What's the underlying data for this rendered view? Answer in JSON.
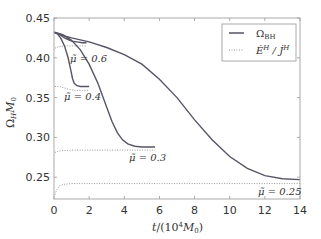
{
  "chart_data": {
    "type": "line",
    "title": "",
    "xlabel": "t/(10^4 M_0)",
    "ylabel": "Ω_H M_0",
    "xlim": [
      0,
      14
    ],
    "ylim": [
      0.222,
      0.45
    ],
    "xticks": [
      0,
      2,
      4,
      6,
      8,
      10,
      12,
      14
    ],
    "yticks": [
      0.25,
      0.3,
      0.35,
      0.4,
      0.45
    ],
    "xtick_labels": [
      "0",
      "2",
      "4",
      "6",
      "8",
      "10",
      "12",
      "14"
    ],
    "ytick_labels": [
      "0.25",
      "0.30",
      "0.35",
      "0.40",
      "0.45"
    ],
    "grid": false,
    "legend": {
      "position": "upper right",
      "entries": [
        {
          "label": "Ω_BH",
          "style": "solid"
        },
        {
          "label": "Ė^H / J̇^H",
          "style": "dotted"
        }
      ]
    },
    "series": [
      {
        "name": "Ω_BH (μ̃=0.6)",
        "style": "solid",
        "mu": "0.6",
        "x": [
          0,
          0.2,
          0.4,
          0.6,
          0.8,
          1.0,
          1.3,
          1.6,
          1.85
        ],
        "y": [
          0.432,
          0.431,
          0.428,
          0.425,
          0.423,
          0.421,
          0.42,
          0.419,
          0.419
        ]
      },
      {
        "name": "Ė^H/J̇^H (μ̃=0.6)",
        "style": "dotted",
        "mu": "0.6",
        "x": [
          0.05,
          0.3,
          0.6,
          1.0,
          1.4,
          1.85
        ],
        "y": [
          0.412,
          0.414,
          0.415,
          0.415,
          0.415,
          0.415
        ]
      },
      {
        "name": "Ω_BH (μ̃=0.4)",
        "style": "solid",
        "mu": "0.4",
        "x": [
          0,
          0.2,
          0.4,
          0.6,
          0.8,
          0.95,
          1.05,
          1.15,
          1.3,
          1.5,
          1.7,
          2.0
        ],
        "y": [
          0.432,
          0.43,
          0.424,
          0.415,
          0.4,
          0.385,
          0.374,
          0.368,
          0.365,
          0.364,
          0.364,
          0.364
        ]
      },
      {
        "name": "Ė^H/J̇^H (μ̃=0.4)",
        "style": "dotted",
        "mu": "0.4",
        "x": [
          0.05,
          0.3,
          0.6,
          0.9,
          1.2,
          1.6,
          2.0
        ],
        "y": [
          0.364,
          0.364,
          0.362,
          0.36,
          0.359,
          0.359,
          0.359
        ]
      },
      {
        "name": "Ω_BH (μ̃=0.3)",
        "style": "solid",
        "mu": "0.3",
        "x": [
          0,
          0.5,
          1.0,
          1.5,
          2.0,
          2.5,
          3.0,
          3.3,
          3.6,
          3.9,
          4.2,
          4.6,
          5.0,
          5.4,
          5.75
        ],
        "y": [
          0.432,
          0.429,
          0.422,
          0.41,
          0.392,
          0.368,
          0.338,
          0.32,
          0.306,
          0.297,
          0.292,
          0.289,
          0.288,
          0.288,
          0.288
        ]
      },
      {
        "name": "Ė^H/J̇^H (μ̃=0.3)",
        "style": "dotted",
        "mu": "0.3",
        "x": [
          0.05,
          0.3,
          1.0,
          2.0,
          3.0,
          4.0,
          5.0,
          5.75
        ],
        "y": [
          0.281,
          0.283,
          0.284,
          0.284,
          0.284,
          0.284,
          0.284,
          0.284
        ]
      },
      {
        "name": "Ω_BH (μ̃=0.25)",
        "style": "solid",
        "mu": "0.25",
        "x": [
          0,
          0.5,
          1,
          2,
          3,
          4,
          5,
          6,
          7,
          8,
          9,
          10,
          11,
          12,
          13,
          14
        ],
        "y": [
          0.432,
          0.428,
          0.425,
          0.42,
          0.413,
          0.404,
          0.392,
          0.373,
          0.35,
          0.322,
          0.297,
          0.276,
          0.261,
          0.252,
          0.248,
          0.247
        ]
      },
      {
        "name": "Ė^H/J̇^H (μ̃=0.25)",
        "style": "dotted",
        "mu": "0.25",
        "x": [
          0.05,
          0.15,
          0.3,
          0.5,
          1,
          3,
          6,
          9,
          12,
          14
        ],
        "y": [
          0.228,
          0.234,
          0.239,
          0.241,
          0.242,
          0.242,
          0.242,
          0.242,
          0.242,
          0.242
        ]
      }
    ],
    "annotations": [
      {
        "text": "μ̃ = 0.6",
        "x": 0.9,
        "y": 0.405
      },
      {
        "text": "μ̃ = 0.4",
        "x": 1.1,
        "y": 0.351
      },
      {
        "text": "μ̃ = 0.3",
        "x": 4.5,
        "y": 0.276
      },
      {
        "text": "μ̃ = 0.25",
        "x": 12.3,
        "y": 0.231
      }
    ]
  },
  "labels": {
    "xlabel_t": "t",
    "xlabel_rest": "/(10",
    "xlabel_exp": "4",
    "xlabel_m": "M",
    "xlabel_sub": "0",
    "xlabel_close": ")",
    "ylabel_omega": "Ω",
    "ylabel_sub": "H",
    "ylabel_m": "M",
    "ylabel_msub": "0",
    "legend_omega": "Ω",
    "legend_omega_sub": "BH",
    "legend_ratio": "Ė",
    "legend_ratio_sup": "H",
    "legend_slash": " / J̇",
    "legend_ratio_sup2": "H",
    "ann_06": "μ̃ = 0.6",
    "ann_04": "μ̃ = 0.4",
    "ann_03": "μ̃ = 0.3",
    "ann_025": "μ̃ = 0.25"
  },
  "colors": {
    "line": "#555566",
    "dotted": "#999999",
    "axis": "#aaaaaa",
    "text": "#333333"
  }
}
